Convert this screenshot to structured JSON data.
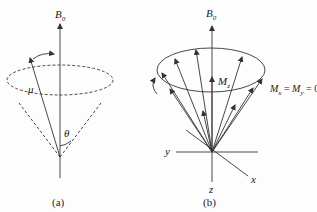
{
  "panels": [
    {
      "id": "a",
      "caption": "(a)",
      "axis_label": "B",
      "axis_label_sub": "0",
      "vector_label": "μ",
      "angle_label": "θ"
    },
    {
      "id": "b",
      "caption": "(b)",
      "axis_label": "B",
      "axis_label_sub": "0",
      "mz_label": "M",
      "mz_sub": "z",
      "equation": {
        "m1": "M",
        "s1": "x",
        "eq1": " = ",
        "m2": "M",
        "s2": "y",
        "eq2": " = 0"
      },
      "x_label": "x",
      "y_label": "y",
      "z_label": "z"
    }
  ],
  "colors": {
    "line": "#333333",
    "background": "#fdfdfd"
  }
}
